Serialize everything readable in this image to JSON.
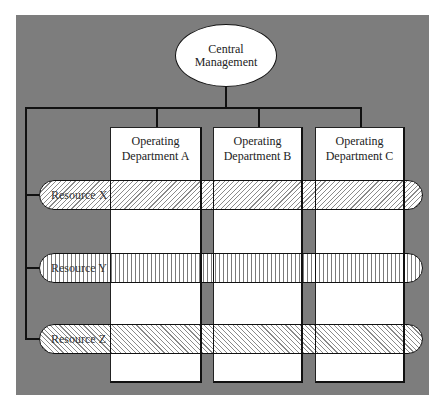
{
  "diagram": {
    "type": "organization-matrix",
    "central": {
      "line1": "Central",
      "line2": "Management"
    },
    "departments": [
      {
        "line1": "Operating",
        "line2": "Department A"
      },
      {
        "line1": "Operating",
        "line2": "Department B"
      },
      {
        "line1": "Operating",
        "line2": "Department C"
      }
    ],
    "resources": [
      {
        "label": "Resource X",
        "pattern": "diagonal-forward-hatch"
      },
      {
        "label": "Resource Y",
        "pattern": "vertical-hatch"
      },
      {
        "label": "Resource Z",
        "pattern": "diagonal-back-hatch"
      }
    ],
    "colors": {
      "background_panel": "#7d7d7d",
      "boxes": "#ffffff",
      "lines": "#111111"
    }
  }
}
